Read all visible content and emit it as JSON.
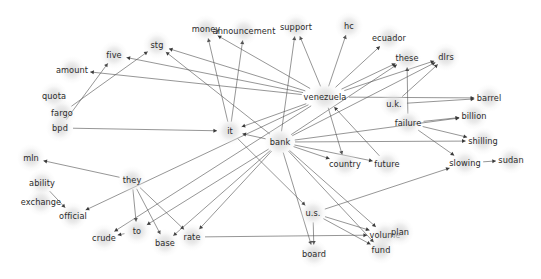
{
  "graph": {
    "title": "word co-occurrence network",
    "type": "directed-node-link-diagram",
    "width": 541,
    "height": 279,
    "background_color": "#ffffff",
    "node_halo_color": "#dcdcdc",
    "edge_color": "#555555",
    "label_color": "#2b2b2b",
    "nodes": [
      {
        "id": "money",
        "label": "money",
        "x": 206,
        "y": 29,
        "r": 13
      },
      {
        "id": "announcement",
        "label": "announcement",
        "x": 244,
        "y": 31,
        "r": 13
      },
      {
        "id": "support",
        "label": "support",
        "x": 296,
        "y": 27,
        "r": 13
      },
      {
        "id": "hc",
        "label": "hc",
        "x": 349,
        "y": 26,
        "r": 13
      },
      {
        "id": "ecuador",
        "label": "ecuador",
        "x": 389,
        "y": 38,
        "r": 13
      },
      {
        "id": "dlrs",
        "label": "dlrs",
        "x": 446,
        "y": 57,
        "r": 13
      },
      {
        "id": "these",
        "label": "these",
        "x": 407,
        "y": 58,
        "r": 13
      },
      {
        "id": "stg",
        "label": "stg",
        "x": 157,
        "y": 45,
        "r": 13
      },
      {
        "id": "five",
        "label": "five",
        "x": 114,
        "y": 55,
        "r": 13
      },
      {
        "id": "amount",
        "label": "amount",
        "x": 72,
        "y": 70,
        "r": 13
      },
      {
        "id": "quota",
        "label": "quota",
        "x": 54,
        "y": 96,
        "r": 13
      },
      {
        "id": "fargo",
        "label": "fargo",
        "x": 62,
        "y": 113,
        "r": 13
      },
      {
        "id": "bpd",
        "label": "bpd",
        "x": 60,
        "y": 128,
        "r": 13
      },
      {
        "id": "venezuela",
        "label": "venezuela",
        "x": 325,
        "y": 97,
        "r": 15
      },
      {
        "id": "barrel",
        "label": "barrel",
        "x": 489,
        "y": 98,
        "r": 13
      },
      {
        "id": "uk",
        "label": "u.k.",
        "x": 394,
        "y": 104,
        "r": 13
      },
      {
        "id": "billion",
        "label": "billion",
        "x": 474,
        "y": 116,
        "r": 13
      },
      {
        "id": "failure",
        "label": "failure",
        "x": 408,
        "y": 123,
        "r": 13
      },
      {
        "id": "it",
        "label": "it",
        "x": 230,
        "y": 131,
        "r": 13
      },
      {
        "id": "shilling",
        "label": "shilling",
        "x": 483,
        "y": 141,
        "r": 13
      },
      {
        "id": "bank",
        "label": "bank",
        "x": 280,
        "y": 142,
        "r": 15
      },
      {
        "id": "country",
        "label": "country",
        "x": 345,
        "y": 164,
        "r": 13
      },
      {
        "id": "future",
        "label": "future",
        "x": 387,
        "y": 164,
        "r": 13
      },
      {
        "id": "slowing",
        "label": "slowing",
        "x": 465,
        "y": 163,
        "r": 13
      },
      {
        "id": "sudan",
        "label": "sudan",
        "x": 511,
        "y": 160,
        "r": 13
      },
      {
        "id": "mln",
        "label": "mln",
        "x": 31,
        "y": 158,
        "r": 13
      },
      {
        "id": "they",
        "label": "they",
        "x": 132,
        "y": 180,
        "r": 13
      },
      {
        "id": "ability",
        "label": "ability",
        "x": 42,
        "y": 183,
        "r": 13
      },
      {
        "id": "exchange",
        "label": "exchange",
        "x": 41,
        "y": 202,
        "r": 13
      },
      {
        "id": "official",
        "label": "official",
        "x": 73,
        "y": 216,
        "r": 13
      },
      {
        "id": "us",
        "label": "u.s.",
        "x": 313,
        "y": 213,
        "r": 13
      },
      {
        "id": "to",
        "label": "to",
        "x": 137,
        "y": 231,
        "r": 13
      },
      {
        "id": "crude",
        "label": "crude",
        "x": 104,
        "y": 238,
        "r": 13
      },
      {
        "id": "base",
        "label": "base",
        "x": 165,
        "y": 243,
        "r": 13
      },
      {
        "id": "rate",
        "label": "rate",
        "x": 192,
        "y": 237,
        "r": 13
      },
      {
        "id": "volume",
        "label": "volume",
        "x": 385,
        "y": 235,
        "r": 13
      },
      {
        "id": "plan",
        "label": "plan",
        "x": 400,
        "y": 232,
        "r": 13
      },
      {
        "id": "fund",
        "label": "fund",
        "x": 381,
        "y": 250,
        "r": 13
      },
      {
        "id": "board",
        "label": "board",
        "x": 314,
        "y": 254,
        "r": 13
      }
    ],
    "edges": [
      {
        "source": "venezuela",
        "target": "five"
      },
      {
        "source": "venezuela",
        "target": "amount"
      },
      {
        "source": "venezuela",
        "target": "stg"
      },
      {
        "source": "venezuela",
        "target": "support"
      },
      {
        "source": "venezuela",
        "target": "these"
      },
      {
        "source": "venezuela",
        "target": "dlrs"
      },
      {
        "source": "venezuela",
        "target": "ecuador"
      },
      {
        "source": "venezuela",
        "target": "barrel"
      },
      {
        "source": "venezuela",
        "target": "country"
      },
      {
        "source": "venezuela",
        "target": "it"
      },
      {
        "source": "venezuela",
        "target": "official"
      },
      {
        "source": "venezuela",
        "target": "crude"
      },
      {
        "source": "venezuela",
        "target": "money"
      },
      {
        "source": "bank",
        "target": "stg"
      },
      {
        "source": "bank",
        "target": "support"
      },
      {
        "source": "bank",
        "target": "these"
      },
      {
        "source": "bank",
        "target": "dlrs"
      },
      {
        "source": "bank",
        "target": "billion"
      },
      {
        "source": "bank",
        "target": "shilling"
      },
      {
        "source": "bank",
        "target": "country"
      },
      {
        "source": "bank",
        "target": "future"
      },
      {
        "source": "bank",
        "target": "it"
      },
      {
        "source": "bank",
        "target": "base"
      },
      {
        "source": "bank",
        "target": "rate"
      },
      {
        "source": "bank",
        "target": "volume"
      },
      {
        "source": "bank",
        "target": "fund"
      },
      {
        "source": "bank",
        "target": "board"
      },
      {
        "source": "bank",
        "target": "to"
      },
      {
        "source": "uk",
        "target": "barrel"
      },
      {
        "source": "uk",
        "target": "dlrs"
      },
      {
        "source": "failure",
        "target": "billion"
      },
      {
        "source": "failure",
        "target": "shilling"
      },
      {
        "source": "failure",
        "target": "slowing"
      },
      {
        "source": "failure",
        "target": "these"
      },
      {
        "source": "slowing",
        "target": "sudan"
      },
      {
        "source": "they",
        "target": "mln"
      },
      {
        "source": "they",
        "target": "to"
      },
      {
        "source": "they",
        "target": "rate"
      },
      {
        "source": "they",
        "target": "base"
      },
      {
        "source": "ability",
        "target": "official"
      },
      {
        "source": "fargo",
        "target": "stg"
      },
      {
        "source": "bpd",
        "target": "five"
      },
      {
        "source": "bpd",
        "target": "it"
      },
      {
        "source": "us",
        "target": "board"
      },
      {
        "source": "us",
        "target": "fund"
      },
      {
        "source": "us",
        "target": "volume"
      },
      {
        "source": "us",
        "target": "slowing"
      },
      {
        "source": "it",
        "target": "money"
      },
      {
        "source": "it",
        "target": "announcement"
      },
      {
        "source": "rate",
        "target": "volume"
      },
      {
        "source": "to",
        "target": "crude"
      },
      {
        "source": "venezuela",
        "target": "hc"
      },
      {
        "source": "future",
        "target": "venezuela"
      },
      {
        "source": "it",
        "target": "us"
      }
    ]
  }
}
